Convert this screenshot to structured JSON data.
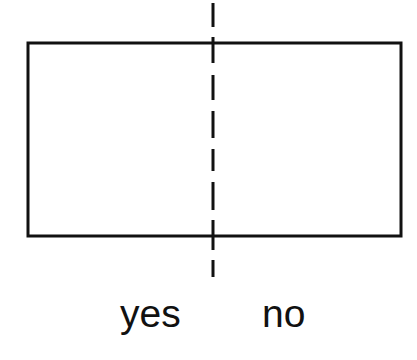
{
  "diagram": {
    "colors": {
      "stroke": "#111111",
      "background": "#ffffff"
    },
    "rectangle": {
      "x": 28,
      "y": 43,
      "width": 373,
      "height": 193,
      "stroke_width": 3
    },
    "divider": {
      "style": "dashed",
      "x": 213,
      "y_start": 3,
      "y_end": 277,
      "dashes": [
        [
          3,
          27
        ],
        [
          37,
          63
        ],
        [
          75,
          100
        ],
        [
          111,
          138
        ],
        [
          149,
          171
        ],
        [
          182,
          210
        ],
        [
          220,
          250
        ],
        [
          260,
          277
        ]
      ]
    },
    "labels": {
      "left": "yes",
      "right": "no"
    }
  }
}
